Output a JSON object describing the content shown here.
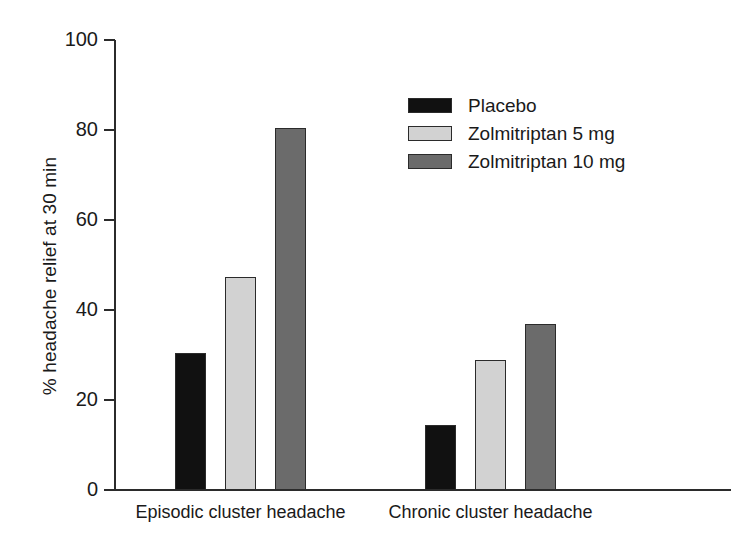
{
  "chart_data": {
    "type": "bar",
    "title": "",
    "subtitle": "",
    "xlabel": "",
    "ylabel": "% headache relief at 30 min",
    "categories": [
      "Episodic cluster headache",
      "Chronic cluster headache"
    ],
    "series": [
      {
        "name": "Placebo",
        "values": [
          30.4,
          14.5
        ],
        "color": "#111111"
      },
      {
        "name": "Zolmitriptan 5 mg",
        "values": [
          47.3,
          28.9
        ],
        "color": "#d2d2d2"
      },
      {
        "name": "Zolmitriptan 10 mg",
        "values": [
          80.4,
          37.0
        ],
        "color": "#6b6b6b"
      }
    ],
    "ylim": [
      0,
      100
    ],
    "yticks": [
      0,
      20,
      40,
      60,
      80,
      100
    ],
    "ytick_labels": [
      "0",
      "20",
      "40",
      "60",
      "80",
      "100"
    ],
    "grid": false,
    "legend_position": "upper-center-right"
  },
  "axis": {
    "y_title": "% headache relief at 30 min",
    "ticks": [
      {
        "label": "100",
        "value": 100
      },
      {
        "label": "80",
        "value": 80
      },
      {
        "label": "60",
        "value": 60
      },
      {
        "label": "40",
        "value": 40
      },
      {
        "label": "20",
        "value": 20
      },
      {
        "label": "0",
        "value": 0
      }
    ]
  },
  "categories": [
    {
      "label": "Episodic cluster headache"
    },
    {
      "label": "Chronic cluster headache"
    }
  ],
  "legend": {
    "items": [
      {
        "label": "Placebo"
      },
      {
        "label": "Zolmitriptan 5 mg"
      },
      {
        "label": "Zolmitriptan 10 mg"
      }
    ]
  }
}
